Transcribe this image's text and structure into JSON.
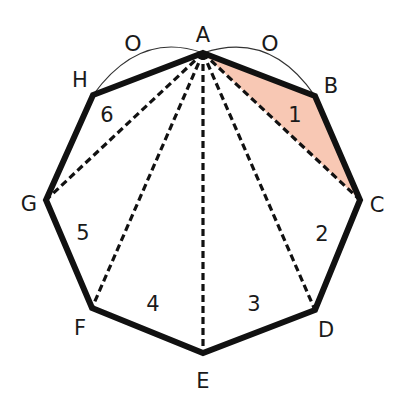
{
  "diagram": {
    "colors": {
      "outline": "#111111",
      "diagonal": "#111111",
      "shaded_fill": "#F8C8B4",
      "arc": "#333333",
      "text": "#1a1a1a"
    },
    "vertices": [
      {
        "id": "A",
        "x": 203,
        "y": 53,
        "label_x": 203,
        "label_y": 35
      },
      {
        "id": "B",
        "x": 315,
        "y": 96,
        "label_x": 331,
        "label_y": 86
      },
      {
        "id": "C",
        "x": 360,
        "y": 200,
        "label_x": 377,
        "label_y": 205
      },
      {
        "id": "D",
        "x": 315,
        "y": 310,
        "label_x": 326,
        "label_y": 330
      },
      {
        "id": "E",
        "x": 203,
        "y": 353,
        "label_x": 203,
        "label_y": 381
      },
      {
        "id": "F",
        "x": 92,
        "y": 308,
        "label_x": 80,
        "label_y": 328
      },
      {
        "id": "G",
        "x": 46,
        "y": 200,
        "label_x": 29,
        "label_y": 204
      },
      {
        "id": "H",
        "x": 93,
        "y": 95,
        "label_x": 80,
        "label_y": 80
      }
    ],
    "triangle_numbers": [
      {
        "n": "1",
        "x": 295,
        "y": 115
      },
      {
        "n": "2",
        "x": 322,
        "y": 234
      },
      {
        "n": "3",
        "x": 254,
        "y": 304
      },
      {
        "n": "4",
        "x": 153,
        "y": 304
      },
      {
        "n": "5",
        "x": 83,
        "y": 233
      },
      {
        "n": "6",
        "x": 107,
        "y": 115
      }
    ],
    "equal_side_marks": [
      {
        "mark": "O",
        "x": 133,
        "y": 43,
        "side": "AH"
      },
      {
        "mark": "O",
        "x": 270,
        "y": 43,
        "side": "AB"
      }
    ],
    "diagonals_from_A": [
      "C",
      "D",
      "E",
      "F",
      "G"
    ],
    "shaded_triangle": [
      "A",
      "B",
      "C"
    ]
  }
}
